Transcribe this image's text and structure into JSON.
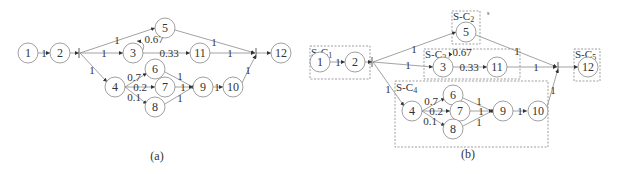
{
  "diagram": {
    "panels": [
      {
        "caption": "(a)",
        "nodes": [
          {
            "id": "1",
            "label": "1",
            "x": 28,
            "y": 53
          },
          {
            "id": "2",
            "label": "2",
            "x": 60,
            "y": 53
          },
          {
            "id": "5",
            "label": "5",
            "x": 165,
            "y": 28
          },
          {
            "id": "3",
            "label": "3",
            "x": 133,
            "y": 53
          },
          {
            "id": "11",
            "label": "11",
            "x": 200,
            "y": 53
          },
          {
            "id": "12",
            "label": "12",
            "x": 281,
            "y": 53
          },
          {
            "id": "4",
            "label": "4",
            "x": 115,
            "y": 87
          },
          {
            "id": "6",
            "label": "6",
            "x": 155,
            "y": 69
          },
          {
            "id": "7",
            "label": "7",
            "x": 165,
            "y": 87
          },
          {
            "id": "8",
            "label": "8",
            "x": 155,
            "y": 107
          },
          {
            "id": "9",
            "label": "9",
            "x": 203,
            "y": 87
          },
          {
            "id": "10",
            "label": "10",
            "x": 233,
            "y": 87
          }
        ],
        "edge_labels": {
          "e1_2": "1",
          "e2_5": "1",
          "e2_3": "1",
          "e2_4": "1",
          "e3_5": "0.67",
          "e3_11": "0.33",
          "e5_12": "1",
          "e11_12": "1",
          "e4_6": "0.7",
          "e4_7": "0.2",
          "e4_8": "0.1",
          "e6_9": "1",
          "e7_9": "1",
          "e8_9": "1",
          "e9_10": "1",
          "e10_12": "1"
        }
      },
      {
        "caption": "(b)",
        "groups": [
          {
            "id": "S-C1",
            "label": "S-C",
            "sub": "1"
          },
          {
            "id": "S-C2",
            "label": "S-C",
            "sub": "2"
          },
          {
            "id": "S-C3",
            "label": "S-C",
            "sub": "3"
          },
          {
            "id": "S-C4",
            "label": "S-C",
            "sub": "4"
          },
          {
            "id": "S-C5",
            "label": "S-C",
            "sub": "5"
          }
        ],
        "nodes": [
          {
            "id": "1",
            "label": "1"
          },
          {
            "id": "2",
            "label": "2"
          },
          {
            "id": "5",
            "label": "5"
          },
          {
            "id": "3",
            "label": "3"
          },
          {
            "id": "11",
            "label": "11"
          },
          {
            "id": "12",
            "label": "12"
          },
          {
            "id": "4",
            "label": "4"
          },
          {
            "id": "6",
            "label": "6"
          },
          {
            "id": "7",
            "label": "7"
          },
          {
            "id": "8",
            "label": "8"
          },
          {
            "id": "9",
            "label": "9"
          },
          {
            "id": "10",
            "label": "10"
          }
        ],
        "edge_labels": {
          "e1_2": "1",
          "e2_5": "1",
          "e2_3": "1",
          "e2_4": "1",
          "e3_5": "0.67",
          "e3_11": "0.33",
          "e5_12": "1",
          "e11_12": "1",
          "e4_6": "0.7",
          "e4_7": "0.2",
          "e4_8": "0.1",
          "e6_9": "1",
          "e7_9": "1",
          "e8_9": "1",
          "e9_10": "1",
          "e10_12": "1"
        },
        "stray_mark": "s"
      }
    ]
  }
}
